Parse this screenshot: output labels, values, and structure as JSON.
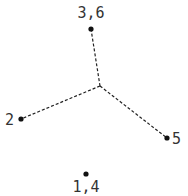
{
  "diagram": {
    "type": "tree",
    "colors": {
      "edge": "#222222",
      "node": "#111111",
      "label": "#333333"
    },
    "center": {
      "x": 100,
      "y": 86
    },
    "nodes": [
      {
        "id": "n36",
        "label": "3,6",
        "x": 91,
        "y": 29,
        "lx": 91,
        "ly": 18,
        "anchor": "middle"
      },
      {
        "id": "n2",
        "label": "2",
        "x": 21,
        "y": 119,
        "lx": 14,
        "ly": 125,
        "anchor": "end"
      },
      {
        "id": "n5",
        "label": "5",
        "x": 167,
        "y": 138,
        "lx": 172,
        "ly": 144,
        "anchor": "start"
      },
      {
        "id": "n14",
        "label": "1,4",
        "x": 86,
        "y": 174,
        "lx": 86,
        "ly": 192,
        "anchor": "middle"
      }
    ],
    "edges": [
      {
        "from": "center",
        "to": "n36"
      },
      {
        "from": "center",
        "to": "n2"
      },
      {
        "from": "center",
        "to": "n5"
      }
    ]
  }
}
